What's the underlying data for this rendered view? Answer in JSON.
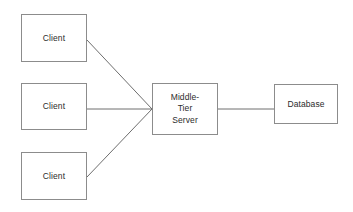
{
  "diagram": {
    "type": "architecture-block-diagram",
    "background_color": "#ffffff",
    "stroke_color": "#8c8c8c",
    "connector_color": "#6e6e6e",
    "text_color": "#2b2b2b",
    "nodes": [
      {
        "id": "client-top",
        "label": "Client",
        "x": 21,
        "y": 14,
        "width": 66,
        "height": 48
      },
      {
        "id": "client-middle",
        "label": "Client",
        "x": 21,
        "y": 83,
        "width": 66,
        "height": 47
      },
      {
        "id": "client-bottom",
        "label": "Client",
        "x": 21,
        "y": 152,
        "width": 66,
        "height": 48
      },
      {
        "id": "middle-tier-server",
        "label": "Middle-\nTier\nServer",
        "x": 152,
        "y": 83,
        "width": 66,
        "height": 52
      },
      {
        "id": "database",
        "label": "Database",
        "x": 274,
        "y": 84,
        "width": 64,
        "height": 40
      }
    ],
    "connectors": [
      {
        "id": "client-top-to-server",
        "from": "client-top",
        "to": "middle-tier-server",
        "x1": 87,
        "y1": 40,
        "x2": 152,
        "y2": 109
      },
      {
        "id": "client-middle-to-server",
        "from": "client-middle",
        "to": "middle-tier-server",
        "x1": 87,
        "y1": 109,
        "x2": 152,
        "y2": 109
      },
      {
        "id": "client-bottom-to-server",
        "from": "client-bottom",
        "to": "middle-tier-server",
        "x1": 87,
        "y1": 177,
        "x2": 152,
        "y2": 109
      },
      {
        "id": "server-to-database",
        "from": "middle-tier-server",
        "to": "database",
        "x1": 218,
        "y1": 109,
        "x2": 274,
        "y2": 109
      }
    ]
  }
}
